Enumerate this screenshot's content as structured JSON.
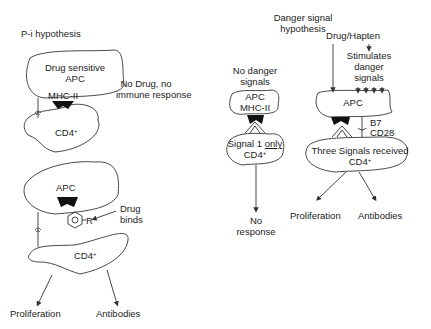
{
  "panel_pi": {
    "title": "P-i hypothesis",
    "top": {
      "apc_label_line1": "Drug sensitive",
      "apc_label_line2": "APC",
      "mhc_label": "MHC-II",
      "cd4_label": "CD4",
      "cd4_sup": "+",
      "note_line1": "No Drug, no",
      "note_line2": "immune response"
    },
    "bottom": {
      "apc_label": "APC",
      "drug_note_line1": "Drug",
      "drug_note_line2": "binds",
      "drug_group": "R",
      "cd4_label": "CD4",
      "cd4_sup": "+",
      "outcome_left": "Proliferation",
      "outcome_right": "Antibodies"
    }
  },
  "panel_danger": {
    "title_line1": "Danger signal",
    "title_line2": "hypothesis",
    "no_danger": {
      "header_line1": "No danger",
      "header_line2": "signals",
      "apc_label": "APC",
      "mhc_label": "MHC-II",
      "cd4_line1_prefix": "Signal 1 ",
      "cd4_line1_underlined": "only",
      "cd4_label": "CD4",
      "cd4_sup": "+",
      "outcome_line1": "No",
      "outcome_line2": "response"
    },
    "with_danger": {
      "drug_label": "Drug/Hapten",
      "stim_line1": "Stimulates",
      "stim_line2": "danger",
      "stim_line3": "signals",
      "apc_label": "APC",
      "b7_label": "B7",
      "cd28_label": "CD28",
      "cd4_line1": "Three Signals received",
      "cd4_label": "CD4",
      "cd4_sup": "+",
      "outcome_left": "Proliferation",
      "outcome_right": "Antibodies"
    }
  }
}
